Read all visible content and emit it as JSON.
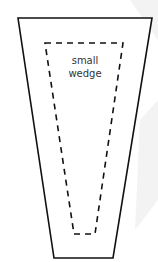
{
  "diagram": {
    "outer_shape": "trapezoid",
    "inner_shape": "dashed-trapezoid",
    "label_line1": "small",
    "label_line2": "wedge",
    "colors": {
      "stroke": "#111111",
      "background": "#ffffff",
      "watermark": "#f0f0f0"
    }
  }
}
